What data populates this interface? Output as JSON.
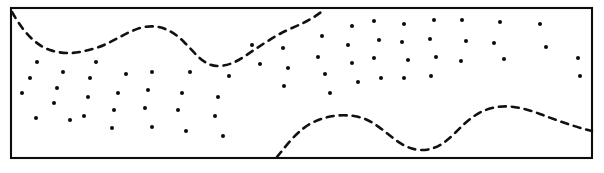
{
  "figure": {
    "kind": "line-art-diagram",
    "canvas": {
      "width": 604,
      "height": 173
    },
    "colors": {
      "background": "#ffffff",
      "ink": "#0d0d0d",
      "dash_ink": "#111111",
      "dot_ink": "#0a0a0a"
    },
    "frame": {
      "label": "rectangular-border",
      "x": 11,
      "y": 8,
      "width": 581,
      "height": 150,
      "stroke_width": 2.1
    },
    "boundaries": [
      {
        "label": "upper-wavy-boundary",
        "dash_pattern": "7 6",
        "stroke_width": 2.6,
        "path": "M 12 12 C 20 26, 32 44, 50 50 C 68 56, 82 52, 96 48 C 112 43, 124 33, 140 28 C 158 23, 172 30, 184 42 C 196 54, 204 66, 218 66 C 232 66, 242 58, 254 50 C 266 42, 278 34, 292 28 C 304 23, 314 18, 325 9"
      },
      {
        "label": "lower-wavy-boundary",
        "dash_pattern": "7 6",
        "stroke_width": 2.6,
        "path": "M 277 157 C 286 146, 296 132, 310 124 C 324 116, 340 114, 354 116 C 368 118, 378 126, 388 134 C 398 142, 408 150, 422 150 C 436 150, 446 142, 456 132 C 466 122, 476 112, 492 108 C 508 104, 524 108, 540 114 C 556 120, 572 126, 592 131"
      }
    ],
    "stipple": {
      "label": "stipple-dot-field",
      "dot_radius": 2.0,
      "count": 62,
      "points": [
        [
          37,
          62
        ],
        [
          30,
          78
        ],
        [
          22,
          93
        ],
        [
          63,
          72
        ],
        [
          57,
          88
        ],
        [
          54,
          103
        ],
        [
          36,
          118
        ],
        [
          70,
          120
        ],
        [
          96,
          62
        ],
        [
          90,
          78
        ],
        [
          88,
          97
        ],
        [
          84,
          116
        ],
        [
          118,
          93
        ],
        [
          114,
          110
        ],
        [
          112,
          128
        ],
        [
          126,
          74
        ],
        [
          152,
          72
        ],
        [
          148,
          90
        ],
        [
          145,
          108
        ],
        [
          152,
          127
        ],
        [
          182,
          93
        ],
        [
          178,
          110
        ],
        [
          186,
          131
        ],
        [
          190,
          72
        ],
        [
          218,
          97
        ],
        [
          215,
          116
        ],
        [
          223,
          136
        ],
        [
          229,
          76
        ],
        [
          252,
          45
        ],
        [
          260,
          64
        ],
        [
          283,
          48
        ],
        [
          288,
          68
        ],
        [
          284,
          86
        ],
        [
          322,
          36
        ],
        [
          318,
          57
        ],
        [
          325,
          74
        ],
        [
          330,
          93
        ],
        [
          352,
          26
        ],
        [
          348,
          45
        ],
        [
          352,
          63
        ],
        [
          358,
          82
        ],
        [
          374,
          21
        ],
        [
          379,
          40
        ],
        [
          374,
          58
        ],
        [
          381,
          78
        ],
        [
          404,
          24
        ],
        [
          402,
          42
        ],
        [
          408,
          60
        ],
        [
          404,
          78
        ],
        [
          434,
          20
        ],
        [
          430,
          39
        ],
        [
          436,
          57
        ],
        [
          431,
          76
        ],
        [
          462,
          20
        ],
        [
          466,
          41
        ],
        [
          461,
          61
        ],
        [
          500,
          22
        ],
        [
          494,
          43
        ],
        [
          504,
          59
        ],
        [
          540,
          24
        ],
        [
          546,
          47
        ],
        [
          578,
          58
        ],
        [
          580,
          76
        ]
      ]
    }
  }
}
